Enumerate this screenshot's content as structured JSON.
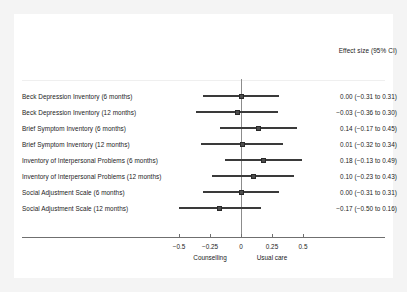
{
  "chart_data": {
    "type": "scatter",
    "subtype": "forest-plot",
    "title": "",
    "xlabel": "",
    "ylabel": "",
    "value_column_header": "Effect size (95% CI)",
    "xlim": [
      -0.625,
      0.66
    ],
    "xticks": [
      -0.5,
      -0.25,
      0,
      0.25,
      0.5
    ],
    "xtick_labels": [
      "−0.5",
      "−0.25",
      "0",
      "0.25",
      "0.5"
    ],
    "grid": false,
    "legend": "none",
    "reference_line": 0,
    "direction_labels": [
      {
        "text": "Counselling",
        "at": -0.25
      },
      {
        "text": "Usual care",
        "at": 0.25
      }
    ],
    "categories": [
      "Beck Depression Inventory (6 months)",
      "Beck Depression Inventory (12 months)",
      "Brief Symptom Inventory (6 months)",
      "Brief Symptom Inventory (12 months)",
      "Inventory of Interpersonal Problems (6 months)",
      "Inventory of Interpersonal Problems (12 months)",
      "Social Adjustment Scale (6 months)",
      "Social Adjustment Scale (12 months)"
    ],
    "values": [
      0.0,
      -0.03,
      0.14,
      0.01,
      0.18,
      0.1,
      0.0,
      -0.17
    ],
    "ci_low": [
      -0.31,
      -0.36,
      -0.17,
      -0.32,
      -0.13,
      -0.23,
      -0.31,
      -0.5
    ],
    "ci_high": [
      0.31,
      0.3,
      0.45,
      0.34,
      0.49,
      0.43,
      0.31,
      0.16
    ],
    "value_labels": [
      "0.00 (−0.31 to 0.31)",
      "−0.03 (−0.36 to 0.30)",
      "0.14 (−0.17 to 0.45)",
      "0.01 (−0.32 to 0.34)",
      "0.18 (−0.13 to 0.49)",
      "0.10 (−0.23 to 0.43)",
      "0.00 (−0.31 to 0.31)",
      "−0.17 (−0.50 to 0.16)"
    ],
    "colors": {
      "marker": "#4d4d4d",
      "marker_edge": "#2a2a2a",
      "ci_line": "#3a3a3a",
      "axis": "#6f6f6f",
      "reference_line": "#8c8c8c",
      "text": "#1b1b1b",
      "panel_background": "#ffffff",
      "figure_background": "#f4f4f4"
    }
  }
}
